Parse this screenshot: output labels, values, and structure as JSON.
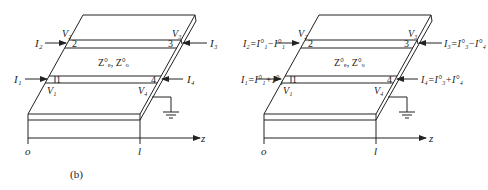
{
  "figures": [
    {
      "id": "left",
      "offset_x": 0,
      "caption": "(b)",
      "impedance_label": "Z",
      "impedance_sub": "e, o",
      "impedance_label_full": "Z°ₑ, Z°ₒ",
      "ports": [
        {
          "num": "1",
          "voltage": "V",
          "voltage_sub": "1",
          "current": "I",
          "current_sub": "1",
          "current_expr": ""
        },
        {
          "num": "2",
          "voltage": "V",
          "voltage_sub": "2",
          "current": "I",
          "current_sub": "2",
          "current_expr": ""
        },
        {
          "num": "3",
          "voltage": "V",
          "voltage_sub": "3",
          "current": "I",
          "current_sub": "3",
          "current_expr": ""
        },
        {
          "num": "4",
          "voltage": "V",
          "voltage_sub": "4",
          "current": "I",
          "current_sub": "4",
          "current_expr": ""
        }
      ],
      "axis": {
        "label": "z",
        "origin": "o",
        "end": "l"
      }
    },
    {
      "id": "right",
      "offset_x": 236,
      "caption": "",
      "impedance_label_full": "Z°ₑ, Z°ₒ",
      "ports": [
        {
          "num": "1",
          "voltage": "V",
          "voltage_sub": "1",
          "current": "I",
          "current_sub": "1",
          "current_expr": "=I°₁+I°₁"
        },
        {
          "num": "2",
          "voltage": "V",
          "voltage_sub": "2",
          "current": "I",
          "current_sub": "2",
          "current_expr": "=I°₁−I°₁"
        },
        {
          "num": "3",
          "voltage": "V",
          "voltage_sub": "3",
          "current": "I",
          "current_sub": "3",
          "current_expr": "=I°₃−I°₄"
        },
        {
          "num": "4",
          "voltage": "V",
          "voltage_sub": "4",
          "current": "I",
          "current_sub": "4",
          "current_expr": "=I°₃+I°₄"
        }
      ],
      "axis": {
        "label": "z",
        "origin": "o",
        "end": "l"
      }
    }
  ],
  "labels": {
    "left": {
      "I1": "I₁",
      "I2": "I₂",
      "I3": "I₃",
      "I4": "I₄",
      "V1": "V₁",
      "V2": "V₂",
      "V3": "V₃",
      "V4": "V₄",
      "p1": "1",
      "p2": "2",
      "p3": "3",
      "p4": "4",
      "Z": "Z°ₑ, Z°ₒ",
      "z": "z",
      "o": "o",
      "l": "l",
      "caption": "(b)"
    },
    "right": {
      "I1": "I₁=I°₁+I°₁",
      "I2": "I₂=I°₁−I°₁",
      "I3": "I₃=I°₃−I°₄",
      "I4": "I₄=I°₃+I°₄",
      "V1": "V₁",
      "V2": "V₂",
      "V3": "V₃",
      "V4": "V₄",
      "p1": "1",
      "p2": "2",
      "p3": "3",
      "p4": "4",
      "Z": "Z°ₑ, Z°ₒ",
      "z": "z",
      "o": "o",
      "l": "l"
    }
  },
  "colors": {
    "line": "#222222",
    "background": "#ffffff"
  }
}
